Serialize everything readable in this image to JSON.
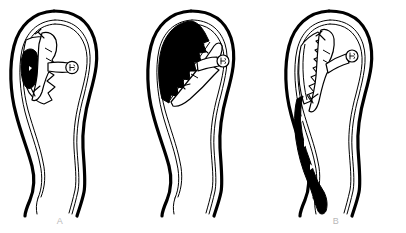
{
  "figure": {
    "background_color": "#ffffff",
    "ink_color": "#000000",
    "blood_color": "#000000",
    "label_color": "#b9b9b9",
    "width": 406,
    "height": 233,
    "panel_count": 3
  },
  "panels": [
    {
      "id": "a",
      "label": "A",
      "caption": "Concealed hemorrhage",
      "hemorrhage_type": "concealed",
      "blood_visible_externally": false,
      "placenta_position": "upper left uterine wall",
      "blood_location": "retroplacental, contained",
      "fetus_present": true,
      "cervix_open": false
    },
    {
      "id": "b",
      "label": "B",
      "caption": "Large retroplacental hemorrhage, concealed",
      "hemorrhage_type": "concealed-extensive",
      "blood_visible_externally": false,
      "placenta_position": "upper left uterine wall",
      "blood_location": "large retroplacental collection along left wall",
      "fetus_present": true,
      "cervix_open": false
    },
    {
      "id": "c",
      "label": "C",
      "caption": "Revealed hemorrhage with vaginal bleeding",
      "hemorrhage_type": "revealed",
      "blood_visible_externally": true,
      "placenta_position": "left uterine wall",
      "blood_location": "marginal, tracking down to cervix and out",
      "fetus_present": true,
      "cervix_open": true
    }
  ],
  "structures": {
    "uterine_wall": "uterine-wall-outline",
    "amnion": "amniotic-membrane-line",
    "placenta": "placenta-serrated",
    "fetus": "fetus-figure",
    "fetal_head": "fetal-head-circle",
    "cervical_canal": "cervix-canal",
    "blood": "blood-collection"
  }
}
